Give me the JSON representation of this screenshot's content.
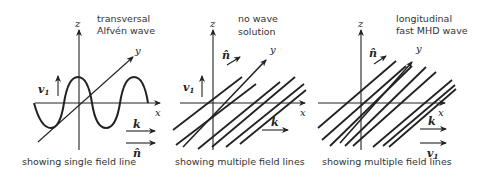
{
  "panels": [
    {
      "title_line1": "transversal",
      "title_line2": "Alfvén wave",
      "caption": "showing single field line",
      "axis_z": "z",
      "axis_y": "y",
      "axis_x": "x",
      "v_label": "v",
      "v_sub": "1",
      "k_label": "k",
      "n_label": "n̂"
    },
    {
      "title_line1": "no wave",
      "title_line2": "solution",
      "caption": "showing multiple field lines",
      "axis_z": "z",
      "axis_y": "y",
      "axis_x": "x",
      "v_label": "v",
      "v_sub": "1",
      "k_label": "k",
      "n_label": "n̂"
    },
    {
      "title_line1": "longitudinal",
      "title_line2": "fast MHD wave",
      "caption": "showing multiple field lines",
      "axis_z": "z",
      "axis_y": "y",
      "axis_x": "x",
      "v_label": "v",
      "v_sub": "1",
      "k_label": "k",
      "n_label": "n̂"
    }
  ],
  "colors": {
    "ink": "#222222",
    "background": "#ffffff"
  }
}
